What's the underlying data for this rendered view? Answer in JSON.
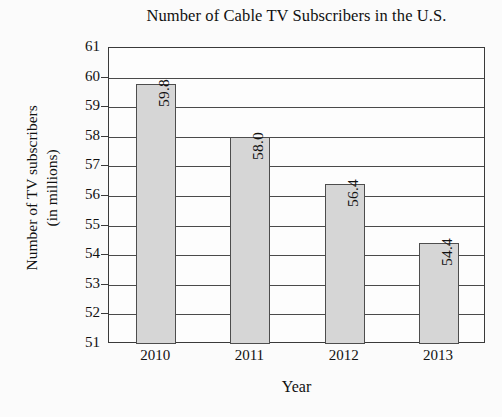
{
  "chart_data": {
    "type": "bar",
    "title": "Number of Cable TV Subscribers in the U.S.",
    "xlabel": "Year",
    "ylabel_lines": [
      "Number of TV subscribers",
      "(in millions)"
    ],
    "ylabel": "Number of TV subscribers (in millions)",
    "categories": [
      "2010",
      "2011",
      "2012",
      "2013"
    ],
    "values": [
      59.8,
      58.0,
      56.4,
      54.4
    ],
    "value_labels": [
      "59.8",
      "58.0",
      "56.4",
      "54.4"
    ],
    "ylim": [
      51,
      61
    ],
    "yticks": [
      61,
      60,
      59,
      58,
      57,
      56,
      55,
      54,
      53,
      52,
      51
    ],
    "ytick_labels": [
      "61",
      "60",
      "59",
      "58",
      "57",
      "56",
      "55",
      "54",
      "53",
      "52",
      "51"
    ],
    "grid": true,
    "grid_orientation": "horizontal",
    "legend": null,
    "bar_fill_color": "#d6d6d6",
    "bar_edge_color": "#4d4d4d",
    "axis_color": "#3a3a3a",
    "background_color": "#fbfbfb",
    "value_label_rotation": 90,
    "value_label_position": "inside-top"
  }
}
